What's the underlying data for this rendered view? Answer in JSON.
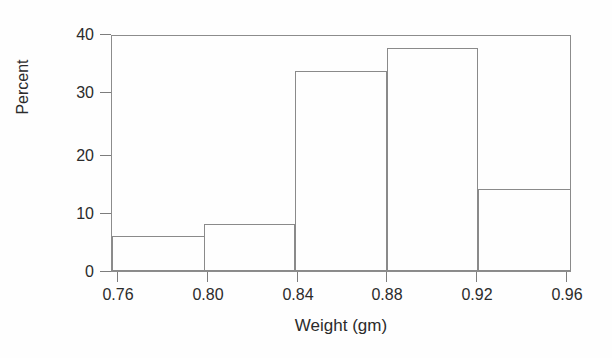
{
  "chart_data": {
    "type": "bar",
    "title": "",
    "subtitle": "",
    "xlabel": "Weight (gm)",
    "ylabel": "Percent",
    "categories": [
      "0.76-0.80",
      "0.80-0.84",
      "0.84-0.88",
      "0.88-0.92",
      "0.92-0.96"
    ],
    "bin_edges": [
      0.76,
      0.8,
      0.84,
      0.88,
      0.92,
      0.96
    ],
    "values": [
      6,
      8,
      34,
      38,
      14
    ],
    "bin_width": 0.04,
    "xlim": [
      0.76,
      0.96
    ],
    "ylim": [
      0,
      40
    ],
    "x_ticks": [
      "0.76",
      "0.80",
      "0.84",
      "0.88",
      "0.92",
      "0.96"
    ],
    "x_tick_values": [
      0.76,
      0.8,
      0.84,
      0.88,
      0.92,
      0.96
    ],
    "y_ticks": [
      "0",
      "10",
      "20",
      "30",
      "40"
    ],
    "y_tick_values": [
      0,
      10,
      20,
      30,
      40
    ],
    "grid": false,
    "legend": null,
    "legend_position": "none",
    "annotations": [],
    "style": {
      "bar_fill": "none",
      "bar_border": "#8a8a8a",
      "axis_color": "#7d7d7d",
      "text_color": "#2b2b2b",
      "background": "#fefefe"
    }
  }
}
